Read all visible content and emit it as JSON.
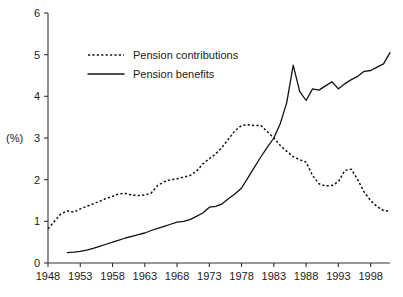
{
  "chart_data": {
    "type": "line",
    "title": "",
    "subtitle": "",
    "xlabel": "",
    "ylabel": "(%)",
    "ylim": [
      0,
      6
    ],
    "xlim": [
      1948,
      2001
    ],
    "grid": false,
    "legend_position": "inside-upper-left",
    "y_ticks": [
      "0",
      "1",
      "2",
      "3",
      "4",
      "5",
      "6"
    ],
    "y_tick_values": [
      0,
      1,
      2,
      3,
      4,
      5,
      6
    ],
    "x_ticks": [
      "1948",
      "1953",
      "1958",
      "1963",
      "1968",
      "1973",
      "1978",
      "1983",
      "1988",
      "1993",
      "1998"
    ],
    "x_tick_values": [
      1948,
      1953,
      1958,
      1963,
      1968,
      1973,
      1978,
      1983,
      1988,
      1993,
      1998
    ],
    "series": [
      {
        "name": "Pension contributions",
        "style": "dotted",
        "color": "#111111",
        "x": [
          1948,
          1949,
          1950,
          1951,
          1952,
          1953,
          1954,
          1955,
          1956,
          1957,
          1958,
          1959,
          1960,
          1961,
          1962,
          1963,
          1964,
          1965,
          1966,
          1967,
          1968,
          1969,
          1970,
          1971,
          1972,
          1973,
          1974,
          1975,
          1976,
          1977,
          1978,
          1979,
          1980,
          1981,
          1982,
          1983,
          1984,
          1985,
          1986,
          1987,
          1988,
          1989,
          1990,
          1991,
          1992,
          1993,
          1994,
          1995,
          1996,
          1997,
          1998,
          1999,
          2000,
          2001
        ],
        "values": [
          0.82,
          1.0,
          1.18,
          1.25,
          1.22,
          1.3,
          1.36,
          1.42,
          1.48,
          1.55,
          1.6,
          1.66,
          1.67,
          1.63,
          1.62,
          1.63,
          1.68,
          1.86,
          1.95,
          2.0,
          2.02,
          2.06,
          2.1,
          2.2,
          2.38,
          2.5,
          2.62,
          2.78,
          2.98,
          3.18,
          3.3,
          3.32,
          3.3,
          3.3,
          3.15,
          3.0,
          2.82,
          2.68,
          2.55,
          2.48,
          2.42,
          2.1,
          1.9,
          1.85,
          1.86,
          1.95,
          2.22,
          2.25,
          2.0,
          1.7,
          1.5,
          1.35,
          1.26,
          1.24
        ]
      },
      {
        "name": "Pension benefits",
        "style": "solid",
        "color": "#111111",
        "x": [
          1951,
          1952,
          1953,
          1954,
          1955,
          1956,
          1957,
          1958,
          1959,
          1960,
          1961,
          1962,
          1963,
          1964,
          1965,
          1966,
          1967,
          1968,
          1969,
          1970,
          1971,
          1972,
          1973,
          1974,
          1975,
          1976,
          1977,
          1978,
          1979,
          1980,
          1981,
          1982,
          1983,
          1984,
          1985,
          1986,
          1987,
          1988,
          1989,
          1990,
          1991,
          1992,
          1993,
          1994,
          1995,
          1996,
          1997,
          1998,
          1999,
          2000,
          2001
        ],
        "values": [
          0.25,
          0.26,
          0.28,
          0.31,
          0.35,
          0.4,
          0.45,
          0.5,
          0.55,
          0.6,
          0.64,
          0.68,
          0.72,
          0.78,
          0.83,
          0.88,
          0.93,
          0.98,
          1.0,
          1.04,
          1.12,
          1.2,
          1.34,
          1.36,
          1.42,
          1.55,
          1.66,
          1.8,
          2.05,
          2.3,
          2.55,
          2.78,
          3.0,
          3.35,
          3.85,
          4.75,
          4.12,
          3.9,
          4.18,
          4.15,
          4.25,
          4.35,
          4.18,
          4.3,
          4.4,
          4.48,
          4.6,
          4.62,
          4.7,
          4.78,
          5.05
        ]
      }
    ]
  },
  "legend": {
    "items": [
      {
        "label": "Pension contributions",
        "style": "dotted"
      },
      {
        "label": "Pension benefits",
        "style": "solid"
      }
    ]
  }
}
